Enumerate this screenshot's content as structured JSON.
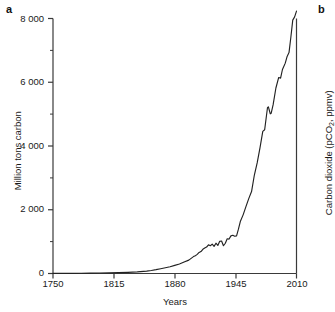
{
  "figure": {
    "panel_a_letter": "a",
    "panel_b_letter": "b",
    "background_color": "#ffffff",
    "line_color": "#222222",
    "axis_color": "#3a3a3a"
  },
  "right_panel": {
    "axis_title_prefix": "Carbon dioxide (pCO",
    "axis_title_sub": "2",
    "axis_title_suffix": ", ppmv)"
  },
  "chart_data": {
    "type": "line",
    "title": "",
    "xlabel": "Years",
    "ylabel": "Million tons carbon",
    "xlim": [
      1750,
      2010
    ],
    "ylim": [
      0,
      8000
    ],
    "grid": false,
    "legend": false,
    "x_tick_labels": [
      "1750",
      "1815",
      "1880",
      "1945",
      "2010"
    ],
    "x_ticks": [
      1750,
      1815,
      1880,
      1945,
      2010
    ],
    "y_tick_labels": [
      "0",
      "2 000",
      "4 000",
      "6 000",
      "8 000"
    ],
    "y_ticks": [
      0,
      2000,
      4000,
      6000,
      8000
    ],
    "y_minor_ticks": [
      1000,
      3000,
      5000,
      7000
    ],
    "series": [
      {
        "name": "Global fossil fuel carbon emissions",
        "x": [
          1750,
          1760,
          1770,
          1780,
          1790,
          1800,
          1810,
          1820,
          1830,
          1840,
          1850,
          1855,
          1860,
          1865,
          1870,
          1875,
          1880,
          1885,
          1890,
          1895,
          1900,
          1902,
          1904,
          1906,
          1908,
          1910,
          1912,
          1914,
          1916,
          1918,
          1920,
          1922,
          1924,
          1926,
          1928,
          1930,
          1932,
          1934,
          1936,
          1938,
          1940,
          1942,
          1944,
          1946,
          1948,
          1950,
          1953,
          1956,
          1959,
          1962,
          1965,
          1968,
          1971,
          1974,
          1976,
          1979,
          1980,
          1982,
          1983,
          1985,
          1988,
          1991,
          1993,
          1995,
          1998,
          2000,
          2002,
          2004,
          2006,
          2008,
          2010
        ],
        "y": [
          3,
          4,
          6,
          8,
          11,
          14,
          20,
          27,
          36,
          50,
          75,
          95,
          120,
          150,
          180,
          210,
          255,
          300,
          360,
          420,
          530,
          560,
          600,
          660,
          690,
          760,
          800,
          830,
          900,
          870,
          920,
          850,
          950,
          880,
          1010,
          1020,
          870,
          950,
          1090,
          1080,
          1180,
          1200,
          1170,
          1180,
          1390,
          1630,
          1840,
          2100,
          2350,
          2570,
          3090,
          3470,
          3940,
          4460,
          4510,
          5200,
          5230,
          5010,
          5030,
          5290,
          5820,
          6150,
          6130,
          6400,
          6600,
          6810,
          6930,
          7420,
          7950,
          8050,
          8230
        ],
        "color": "#222222"
      }
    ]
  }
}
